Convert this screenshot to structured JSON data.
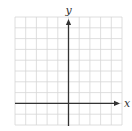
{
  "diagram": {
    "type": "coordinate-plane",
    "grid": {
      "columns": 10,
      "rows": 10,
      "left": 15,
      "top": 17,
      "right": 122,
      "bottom": 125,
      "line_color": "#d6d6d6"
    },
    "axes": {
      "color": "#333333",
      "x_axis_row_line": 8,
      "y_axis_column_line": 5,
      "x_label": "x",
      "y_label": "y"
    }
  }
}
